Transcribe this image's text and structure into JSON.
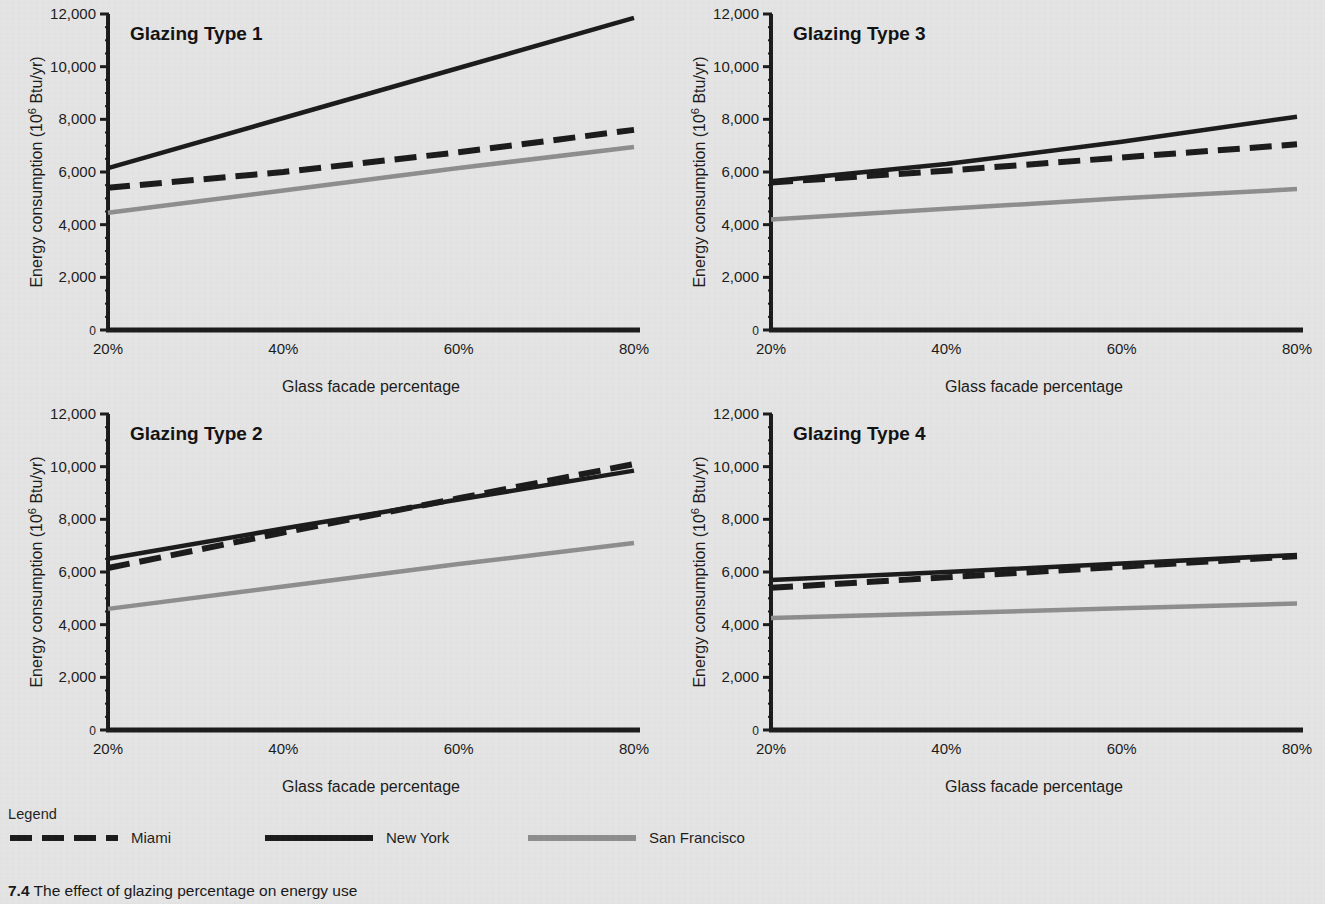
{
  "figure": {
    "caption_number": "7.4",
    "caption_text": "The effect of glazing percentage on energy use",
    "background_color": "#e4e4e4"
  },
  "legend": {
    "title": "Legend",
    "entries": [
      {
        "label": "Miami",
        "style": "dashed",
        "color": "#1a1a1a"
      },
      {
        "label": "New York",
        "style": "solid",
        "color": "#1a1a1a"
      },
      {
        "label": "San Francisco",
        "style": "solid",
        "color": "#8d8d8d"
      }
    ]
  },
  "chart_data": [
    {
      "type": "line",
      "title": "Glazing Type 1",
      "xlabel": "Glass facade percentage",
      "ylabel": "Energy consumption (10⁶ Btu/yr)",
      "ylabel_parts": {
        "pre": "Energy consumption (10",
        "sup": "6",
        "post": " Btu/yr)"
      },
      "x": [
        20,
        40,
        60,
        80
      ],
      "xticklabels": [
        "20%",
        "40%",
        "60%",
        "80%"
      ],
      "yticks": [
        0,
        2000,
        4000,
        6000,
        8000,
        10000,
        12000
      ],
      "yticklabels": [
        "0",
        "2,000",
        "4,000",
        "6,000",
        "8,000",
        "10,000",
        "12,000"
      ],
      "xlim": [
        20,
        80
      ],
      "ylim": [
        0,
        12000
      ],
      "grid": false,
      "legend_position": "external-bottom",
      "series": [
        {
          "name": "New York",
          "style": "solid",
          "color": "#1a1a1a",
          "values": [
            6150,
            8050,
            9950,
            11850
          ]
        },
        {
          "name": "Miami",
          "style": "dashed",
          "color": "#1a1a1a",
          "values": [
            5400,
            6000,
            6750,
            7600
          ]
        },
        {
          "name": "San Francisco",
          "style": "solid",
          "color": "#8d8d8d",
          "values": [
            4450,
            5300,
            6150,
            6950
          ]
        }
      ]
    },
    {
      "type": "line",
      "title": "Glazing Type 3",
      "xlabel": "Glass facade percentage",
      "ylabel": "Energy consumption (10⁶ Btu/yr)",
      "ylabel_parts": {
        "pre": "Energy consumption (10",
        "sup": "6",
        "post": " Btu/yr)"
      },
      "x": [
        20,
        40,
        60,
        80
      ],
      "xticklabels": [
        "20%",
        "40%",
        "60%",
        "80%"
      ],
      "yticks": [
        0,
        2000,
        4000,
        6000,
        8000,
        10000,
        12000
      ],
      "yticklabels": [
        "0",
        "2,000",
        "4,000",
        "6,000",
        "8,000",
        "10,000",
        "12,000"
      ],
      "xlim": [
        20,
        80
      ],
      "ylim": [
        0,
        12000
      ],
      "grid": false,
      "legend_position": "external-bottom",
      "series": [
        {
          "name": "New York",
          "style": "solid",
          "color": "#1a1a1a",
          "values": [
            5650,
            6300,
            7150,
            8100
          ]
        },
        {
          "name": "Miami",
          "style": "dashed",
          "color": "#1a1a1a",
          "values": [
            5600,
            6050,
            6550,
            7050
          ]
        },
        {
          "name": "San Francisco",
          "style": "solid",
          "color": "#8d8d8d",
          "values": [
            4200,
            4600,
            5000,
            5350
          ]
        }
      ]
    },
    {
      "type": "line",
      "title": "Glazing Type 2",
      "xlabel": "Glass facade percentage",
      "ylabel": "Energy consumption (10⁶ Btu/yr)",
      "ylabel_parts": {
        "pre": "Energy consumption (10",
        "sup": "6",
        "post": " Btu/yr)"
      },
      "x": [
        20,
        40,
        60,
        80
      ],
      "xticklabels": [
        "20%",
        "40%",
        "60%",
        "80%"
      ],
      "yticks": [
        0,
        2000,
        4000,
        6000,
        8000,
        10000,
        12000
      ],
      "yticklabels": [
        "0",
        "2,000",
        "4,000",
        "6,000",
        "8,000",
        "10,000",
        "12,000"
      ],
      "xlim": [
        20,
        80
      ],
      "ylim": [
        0,
        12000
      ],
      "grid": false,
      "legend_position": "external-bottom",
      "series": [
        {
          "name": "New York",
          "style": "solid",
          "color": "#1a1a1a",
          "values": [
            6500,
            7650,
            8750,
            9850
          ]
        },
        {
          "name": "Miami",
          "style": "dashed",
          "color": "#1a1a1a",
          "values": [
            6150,
            7500,
            8800,
            10100
          ]
        },
        {
          "name": "San Francisco",
          "style": "solid",
          "color": "#8d8d8d",
          "values": [
            4600,
            5450,
            6300,
            7100
          ]
        }
      ]
    },
    {
      "type": "line",
      "title": "Glazing Type 4",
      "xlabel": "Glass facade percentage",
      "ylabel": "Energy consumption (10⁶ Btu/yr)",
      "ylabel_parts": {
        "pre": "Energy consumption (10",
        "sup": "6",
        "post": " Btu/yr)"
      },
      "x": [
        20,
        40,
        60,
        80
      ],
      "xticklabels": [
        "20%",
        "40%",
        "60%",
        "80%"
      ],
      "yticks": [
        0,
        2000,
        4000,
        6000,
        8000,
        10000,
        12000
      ],
      "yticklabels": [
        "0",
        "2,000",
        "4,000",
        "6,000",
        "8,000",
        "10,000",
        "12,000"
      ],
      "xlim": [
        20,
        80
      ],
      "ylim": [
        0,
        12000
      ],
      "grid": false,
      "legend_position": "external-bottom",
      "series": [
        {
          "name": "New York",
          "style": "solid",
          "color": "#1a1a1a",
          "values": [
            5700,
            6000,
            6320,
            6650
          ]
        },
        {
          "name": "Miami",
          "style": "dashed",
          "color": "#1a1a1a",
          "values": [
            5400,
            5800,
            6200,
            6600
          ]
        },
        {
          "name": "San Francisco",
          "style": "solid",
          "color": "#8d8d8d",
          "values": [
            4250,
            4430,
            4620,
            4800
          ]
        }
      ]
    }
  ]
}
